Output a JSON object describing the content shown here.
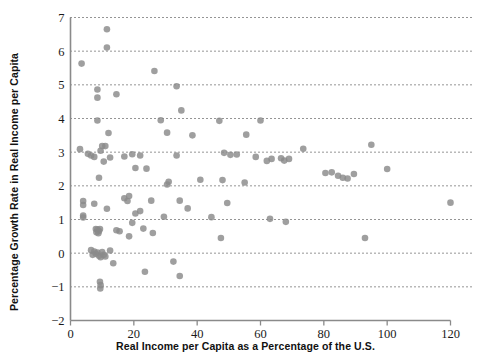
{
  "chart_data": {
    "type": "scatter",
    "title": "",
    "xlabel": "Real Income per Capita as a Percentage of the U.S.",
    "ylabel": "Percentage Growth Rate in Real Income per Capita",
    "xlim": [
      0,
      120
    ],
    "ylim": [
      -2,
      7
    ],
    "xticks": [
      0,
      20,
      40,
      60,
      80,
      100,
      120
    ],
    "yticks": [
      -2,
      -1,
      0,
      1,
      2,
      3,
      4,
      5,
      6,
      7
    ],
    "grid": "horizontal-dotted",
    "legend": "none",
    "marker": {
      "shape": "circle",
      "color": "#8a8a8a",
      "size": 3.3
    },
    "axis_color": "#8a8a8a",
    "points": [
      [
        3.5,
        5.63
      ],
      [
        11.5,
        6.65
      ],
      [
        11.5,
        6.11
      ],
      [
        26.5,
        5.41
      ],
      [
        33.5,
        4.96
      ],
      [
        8.5,
        4.86
      ],
      [
        14.5,
        4.72
      ],
      [
        8.5,
        4.62
      ],
      [
        35.0,
        4.24
      ],
      [
        28.5,
        3.95
      ],
      [
        8.5,
        3.94
      ],
      [
        47.0,
        3.93
      ],
      [
        60.0,
        3.94
      ],
      [
        12.0,
        3.57
      ],
      [
        30.5,
        3.58
      ],
      [
        55.5,
        3.52
      ],
      [
        38.5,
        3.5
      ],
      [
        3.0,
        3.09
      ],
      [
        11.0,
        3.18
      ],
      [
        10.0,
        3.18
      ],
      [
        9.5,
        3.04
      ],
      [
        5.5,
        2.95
      ],
      [
        6.5,
        2.9
      ],
      [
        7.5,
        2.86
      ],
      [
        19.5,
        2.94
      ],
      [
        17.0,
        2.87
      ],
      [
        22.0,
        2.9
      ],
      [
        33.5,
        2.9
      ],
      [
        52.5,
        2.93
      ],
      [
        58.5,
        2.86
      ],
      [
        63.5,
        2.8
      ],
      [
        66.5,
        2.82
      ],
      [
        69.0,
        2.8
      ],
      [
        12.5,
        2.84
      ],
      [
        10.5,
        2.72
      ],
      [
        48.5,
        2.98
      ],
      [
        50.5,
        2.92
      ],
      [
        62.0,
        2.74
      ],
      [
        73.5,
        3.1
      ],
      [
        95.0,
        3.22
      ],
      [
        67.5,
        2.75
      ],
      [
        20.5,
        2.53
      ],
      [
        24.0,
        2.51
      ],
      [
        9.0,
        2.24
      ],
      [
        31.0,
        2.12
      ],
      [
        30.5,
        2.04
      ],
      [
        48.0,
        2.17
      ],
      [
        55.0,
        2.1
      ],
      [
        41.0,
        2.18
      ],
      [
        80.5,
        2.38
      ],
      [
        82.5,
        2.4
      ],
      [
        84.5,
        2.3
      ],
      [
        87.5,
        2.22
      ],
      [
        89.5,
        2.35
      ],
      [
        100.0,
        2.5
      ],
      [
        86.0,
        2.24
      ],
      [
        4.0,
        1.55
      ],
      [
        4.0,
        1.43
      ],
      [
        7.5,
        1.47
      ],
      [
        17.0,
        1.63
      ],
      [
        18.5,
        1.7
      ],
      [
        25.5,
        1.56
      ],
      [
        34.5,
        1.56
      ],
      [
        49.5,
        1.49
      ],
      [
        18.0,
        1.55
      ],
      [
        120.0,
        1.5
      ],
      [
        4.0,
        1.12
      ],
      [
        4.0,
        1.06
      ],
      [
        11.5,
        1.32
      ],
      [
        20.5,
        1.18
      ],
      [
        22.0,
        1.25
      ],
      [
        29.5,
        1.08
      ],
      [
        37.0,
        1.33
      ],
      [
        44.5,
        1.07
      ],
      [
        63.0,
        1.02
      ],
      [
        68.0,
        0.93
      ],
      [
        19.5,
        0.9
      ],
      [
        8.0,
        0.72
      ],
      [
        8.5,
        0.7
      ],
      [
        9.0,
        0.66
      ],
      [
        8.2,
        0.62
      ],
      [
        8.8,
        0.59
      ],
      [
        9.3,
        0.72
      ],
      [
        14.5,
        0.68
      ],
      [
        15.5,
        0.65
      ],
      [
        23.0,
        0.73
      ],
      [
        26.0,
        0.6
      ],
      [
        18.5,
        0.5
      ],
      [
        47.5,
        0.45
      ],
      [
        6.5,
        0.09
      ],
      [
        7.5,
        0.05
      ],
      [
        8.0,
        -0.02
      ],
      [
        8.5,
        0.02
      ],
      [
        9.0,
        -0.08
      ],
      [
        9.5,
        -0.12
      ],
      [
        10.0,
        0.03
      ],
      [
        10.5,
        -0.05
      ],
      [
        12.5,
        0.08
      ],
      [
        11.0,
        -0.1
      ],
      [
        7.0,
        -0.05
      ],
      [
        13.5,
        -0.3
      ],
      [
        32.5,
        -0.25
      ],
      [
        93.0,
        0.45
      ],
      [
        23.5,
        -0.55
      ],
      [
        34.5,
        -0.68
      ],
      [
        9.3,
        -0.85
      ],
      [
        9.5,
        -0.95
      ],
      [
        9.4,
        -1.05
      ]
    ]
  }
}
